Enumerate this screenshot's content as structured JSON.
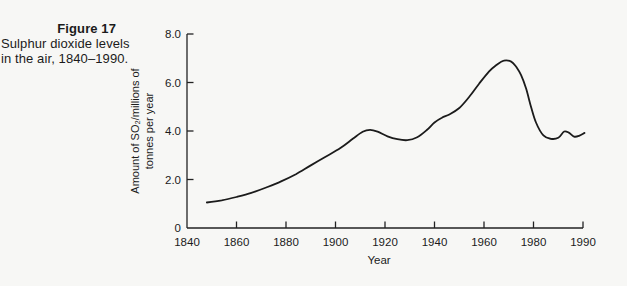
{
  "caption": {
    "title": "Figure 17",
    "lines": [
      "Sulphur dioxide levels",
      "in the air, 1840–1990."
    ]
  },
  "colors": {
    "background": "#f7f7f5",
    "axis": "#222222",
    "text": "#1b1b1b",
    "curve": "#1b1b1b"
  },
  "chart_data": {
    "type": "line",
    "title": "Sulphur dioxide levels in the air, 1840–1990",
    "xlabel": "Year",
    "ylabel": "Amount of SO₂/millions of tonnes per year",
    "ylabel_lines": [
      "Amount of SO₂/millions of",
      "tonnes per year"
    ],
    "xlim": [
      1840,
      1990
    ],
    "ylim": [
      0,
      8
    ],
    "grid": false,
    "legend": "none",
    "x_axis": {
      "ticks": [
        {
          "year": 1840,
          "label": "1840"
        },
        {
          "year": 1860,
          "label": "1860"
        },
        {
          "year": 1880,
          "label": "1880"
        },
        {
          "year": 1900,
          "label": "1900"
        },
        {
          "year": 1920,
          "label": "1920"
        },
        {
          "year": 1940,
          "label": "1940"
        },
        {
          "year": 1960,
          "label": "1960"
        },
        {
          "year": 1980,
          "label": "1980"
        },
        {
          "year": 1990,
          "label": "1990"
        }
      ],
      "note": "final 1980–1990 interval is drawn the same width as the preceding 20-year intervals"
    },
    "y_axis": {
      "ticks": [
        {
          "value": 8,
          "label": "8.0"
        },
        {
          "value": 6,
          "label": "6.0"
        },
        {
          "value": 4,
          "label": "4.0"
        },
        {
          "value": 2,
          "label": "2.0"
        },
        {
          "value": 0,
          "label": "0"
        }
      ]
    },
    "series": [
      {
        "name": "Amount of SO2 in the air",
        "color": "#1b1b1b",
        "points": [
          [
            1848,
            1.05
          ],
          [
            1854,
            1.14
          ],
          [
            1860,
            1.28
          ],
          [
            1866,
            1.45
          ],
          [
            1872,
            1.67
          ],
          [
            1878,
            1.92
          ],
          [
            1884,
            2.22
          ],
          [
            1890,
            2.58
          ],
          [
            1896,
            2.94
          ],
          [
            1902,
            3.3
          ],
          [
            1907,
            3.68
          ],
          [
            1911,
            3.97
          ],
          [
            1914,
            4.05
          ],
          [
            1917,
            3.97
          ],
          [
            1921,
            3.78
          ],
          [
            1925,
            3.66
          ],
          [
            1929,
            3.62
          ],
          [
            1933,
            3.74
          ],
          [
            1937,
            4.05
          ],
          [
            1940,
            4.35
          ],
          [
            1943,
            4.55
          ],
          [
            1946,
            4.68
          ],
          [
            1950,
            4.95
          ],
          [
            1954,
            5.4
          ],
          [
            1958,
            5.95
          ],
          [
            1962,
            6.45
          ],
          [
            1965,
            6.72
          ],
          [
            1968,
            6.9
          ],
          [
            1971,
            6.86
          ],
          [
            1973,
            6.65
          ],
          [
            1975,
            6.3
          ],
          [
            1977,
            5.75
          ],
          [
            1979,
            5.0
          ],
          [
            1980.5,
            4.35
          ],
          [
            1982,
            3.82
          ],
          [
            1983.5,
            3.68
          ],
          [
            1985,
            3.72
          ],
          [
            1986.2,
            3.98
          ],
          [
            1987.2,
            3.92
          ],
          [
            1988.2,
            3.77
          ],
          [
            1989.2,
            3.8
          ],
          [
            1990.3,
            3.92
          ]
        ]
      }
    ]
  }
}
